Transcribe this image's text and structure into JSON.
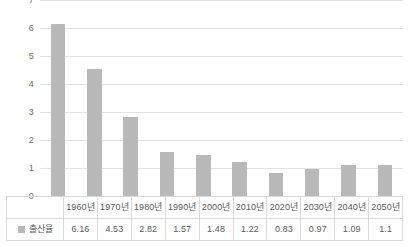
{
  "chart_data": {
    "type": "bar",
    "title": "",
    "subtitle": "",
    "xlabel": "",
    "ylabel": "",
    "ylim": [
      0,
      7
    ],
    "ytick_labels": [
      "7",
      "6",
      "5",
      "4",
      "3",
      "2",
      "1",
      "0"
    ],
    "yticks": [
      7,
      6,
      5,
      4,
      3,
      2,
      1,
      0
    ],
    "grid": true,
    "legend_position": "table-left",
    "categories": [
      "1960년",
      "1970년",
      "1980년",
      "1990년",
      "2000년",
      "2010년",
      "2020년",
      "2030년",
      "2040년",
      "2050년"
    ],
    "series": [
      {
        "name": "출산율",
        "values": [
          6.16,
          4.53,
          2.82,
          1.57,
          1.48,
          1.22,
          0.83,
          0.97,
          1.09,
          1.1
        ],
        "value_labels": [
          "6.16",
          "4.53",
          "2.82",
          "1.57",
          "1.48",
          "1.22",
          "0.83",
          "0.97",
          "1.09",
          "1.1"
        ],
        "color": "#b9b9b9"
      }
    ]
  },
  "legend": {
    "label": "출산율",
    "swatch_color": "#b9b9b9"
  },
  "colors": {
    "bar": "#b9b9b9",
    "gridline": "#e2e2e2",
    "baseline": "#cfcfcf",
    "table_border": "#d9d9d9",
    "text": "#5a5a5a",
    "background": "#ffffff"
  }
}
